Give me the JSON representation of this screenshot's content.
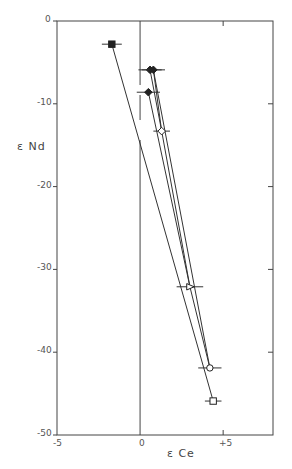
{
  "chart_data": {
    "type": "scatter",
    "title": "",
    "xlabel": "ε Ce",
    "ylabel": "ε Nd",
    "xlim": [
      -5,
      8
    ],
    "ylim": [
      -50,
      0
    ],
    "grid": false,
    "x_ticks": [
      -5,
      0,
      5
    ],
    "x_tick_labels": [
      "-5",
      "0",
      "+5"
    ],
    "y_ticks": [
      0,
      -10,
      -20,
      -30,
      -40,
      -50
    ],
    "y_tick_labels": [
      "0",
      "-10",
      "-20",
      "-30",
      "-40",
      "-50"
    ],
    "zero_line": {
      "x": 0
    },
    "points": [
      {
        "id": "p1",
        "marker": "filled-square",
        "x": -1.7,
        "y": -2.8,
        "xerr": 0.6
      },
      {
        "id": "p2",
        "marker": "filled-diamond",
        "x": 0.6,
        "y": -5.9,
        "xerr": 0.7
      },
      {
        "id": "p3",
        "marker": "filled-diamond",
        "x": 0.8,
        "y": -5.9,
        "xerr": 0.7
      },
      {
        "id": "p4",
        "marker": "filled-diamond",
        "x": 0.5,
        "y": -8.6,
        "xerr": 0.7
      },
      {
        "id": "p5",
        "marker": "open-diamond",
        "x": 1.3,
        "y": -13.3,
        "xerr": 0.5
      },
      {
        "id": "p6",
        "marker": "open-triangle",
        "x": 3.0,
        "y": -32.1,
        "xerr": 0.8
      },
      {
        "id": "p7",
        "marker": "open-circle",
        "x": 4.2,
        "y": -41.9,
        "xerr": 0.7
      },
      {
        "id": "p8",
        "marker": "open-square",
        "x": 4.4,
        "y": -45.9,
        "xerr": 0.5
      }
    ],
    "lines": [
      {
        "from": "p1",
        "to": "p8"
      },
      {
        "from": "p4",
        "to": "p6"
      },
      {
        "from": "p2",
        "to": "p5"
      },
      {
        "from": "p3",
        "to": "p5"
      },
      {
        "from": "p5",
        "to": "p6"
      },
      {
        "from": "p3",
        "to": "p7"
      },
      {
        "from": "p6",
        "to": "p7"
      }
    ]
  },
  "labels": {
    "x_axis_title": "ε Ce",
    "y_axis_title": "ε Nd",
    "y0": "0",
    "y10": "-10",
    "y20": "-20",
    "y30": "-30",
    "y40": "-40",
    "y50": "-50",
    "xm5": "-5",
    "x0": "0",
    "xp5": "+5"
  }
}
